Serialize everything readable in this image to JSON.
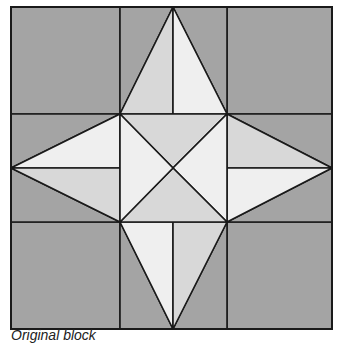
{
  "figure": {
    "caption": "Original block",
    "grid": "3x3",
    "pattern": "four-point star with hourglass center"
  },
  "colors": {
    "background_dark": "#a4a4a4",
    "star_mid": "#d8d8d8",
    "star_light": "#efefef",
    "outline": "#1a1a1a"
  }
}
